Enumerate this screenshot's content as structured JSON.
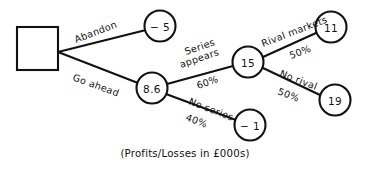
{
  "diagram": {
    "caption": "(Profits/Losses in £000s)",
    "units_note": "Profits/Losses in £000s",
    "line_color": "#111111",
    "fill_color": "#ffffff",
    "decision_node": {
      "id": "decision-square",
      "shape": "square",
      "label": ""
    },
    "nodes": [
      {
        "id": "node-minus5",
        "shape": "circle",
        "label": "− 5",
        "value": -5,
        "cx": 160,
        "cy": 26,
        "r": 15.5
      },
      {
        "id": "node-8-6",
        "shape": "circle",
        "label": "8.6",
        "value": 8.6,
        "cx": 152,
        "cy": 88,
        "r": 15.5
      },
      {
        "id": "node-15",
        "shape": "circle",
        "label": "15",
        "value": 15,
        "cx": 248,
        "cy": 62,
        "r": 15.5
      },
      {
        "id": "node-minus1",
        "shape": "circle",
        "label": "− 1",
        "value": -1,
        "cx": 250,
        "cy": 125,
        "r": 15.5
      },
      {
        "id": "node-11",
        "shape": "circle",
        "label": "11",
        "value": 11,
        "cx": 331,
        "cy": 27,
        "r": 15.5
      },
      {
        "id": "node-19",
        "shape": "circle",
        "label": "19",
        "value": 19,
        "cx": 335,
        "cy": 100,
        "r": 15.5
      }
    ],
    "branches": [
      {
        "id": "branch-abandon",
        "from": "decision-square",
        "to": "node-minus5",
        "label": "Abandon",
        "probability": "",
        "label_x": 76,
        "label_y": 43,
        "label_rotate": -21,
        "prob_x": 0,
        "prob_y": 0,
        "prob_rotate": 0
      },
      {
        "id": "branch-go-ahead",
        "from": "decision-square",
        "to": "node-8-6",
        "label": "Go ahead",
        "probability": "",
        "label_x": 72,
        "label_y": 80,
        "label_rotate": 20,
        "prob_x": 0,
        "prob_y": 0,
        "prob_rotate": 0
      },
      {
        "id": "branch-series-appears",
        "from": "node-8-6",
        "to": "node-15",
        "label": "Series\nappears",
        "label_line1": "Series",
        "label_line2": "appears",
        "probability": "60%",
        "label_x": 186,
        "label_y": 55,
        "label_rotate": -19,
        "prob_x": 198,
        "prob_y": 89,
        "prob_rotate": -19
      },
      {
        "id": "branch-no-series",
        "from": "node-8-6",
        "to": "node-minus1",
        "label": "No series",
        "probability": "40%",
        "label_x": 188,
        "label_y": 104,
        "label_rotate": 21,
        "prob_x": 190,
        "prob_y": 122,
        "prob_rotate": 21
      },
      {
        "id": "branch-rival-markets",
        "from": "node-15",
        "to": "node-11",
        "label": "Rival markets",
        "probability": "50%",
        "label_x": 266,
        "label_y": 47,
        "label_rotate": -21,
        "prob_x": 292,
        "prob_y": 59,
        "prob_rotate": -21
      },
      {
        "id": "branch-no-rival",
        "from": "node-15",
        "to": "node-19",
        "label": "No rival",
        "probability": "50%",
        "label_x": 279,
        "label_y": 76,
        "label_rotate": 21,
        "prob_x": 281,
        "prob_y": 95,
        "prob_rotate": 21
      }
    ]
  }
}
